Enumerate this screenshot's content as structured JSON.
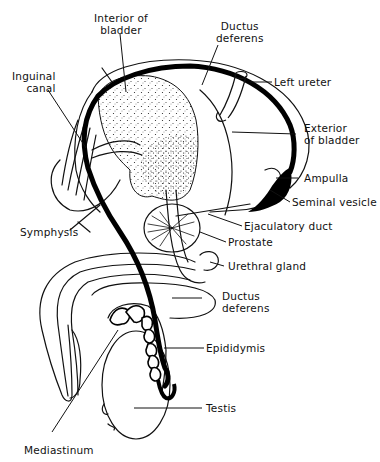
{
  "diagram": {
    "labels": {
      "interior_of_bladder": [
        "Interior of",
        "bladder"
      ],
      "ductus_deferens_top": [
        "Ductus",
        "deferens"
      ],
      "inguinal_canal": [
        "Inguinal",
        "canal"
      ],
      "left_ureter": "Left ureter",
      "exterior_of_bladder": [
        "Exterior",
        "of bladder"
      ],
      "ampulla": "Ampulla",
      "seminal_vesicle": "Seminal vesicle",
      "ejaculatory_duct": "Ejaculatory duct",
      "symphysis": "Symphysis",
      "prostate": "Prostate",
      "urethral_gland": "Urethral gland",
      "ductus_deferens_bottom": [
        "Ductus",
        "deferens"
      ],
      "epididymis": "Epididymis",
      "testis": "Testis",
      "mediastinum": "Mediastinum"
    },
    "colors": {
      "ink": "#111111",
      "background": "#ffffff"
    }
  }
}
